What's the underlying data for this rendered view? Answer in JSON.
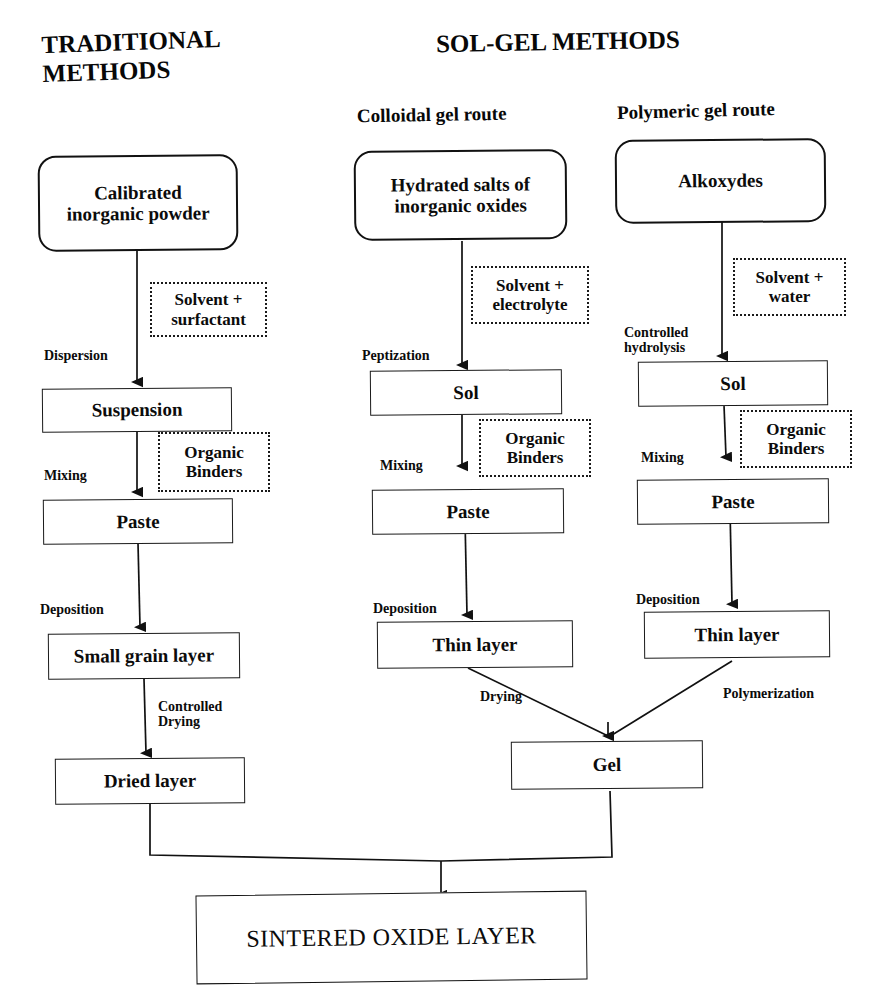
{
  "diagram": {
    "title_left": "TRADITIONAL\nMETHODS",
    "title_right": "SOL-GEL METHODS",
    "subtitle_colloidal": "Colloidal gel route",
    "subtitle_polymeric": "Polymeric gel route",
    "colors": {
      "ink": "#111111",
      "paper": "#ffffff"
    }
  },
  "traditional": {
    "start": "Calibrated\ninorganic powder",
    "reagent_1": "Solvent +\nsurfactant",
    "step_1": "Dispersion",
    "node_1": "Suspension",
    "reagent_2": "Organic\nBinders",
    "step_2": "Mixing",
    "node_2": "Paste",
    "step_3": "Deposition",
    "node_3": "Small grain layer",
    "step_4": "Controlled\nDrying",
    "node_4": "Dried layer"
  },
  "colloidal": {
    "start": "Hydrated salts of\ninorganic oxides",
    "reagent_1": "Solvent +\nelectrolyte",
    "step_1": "Peptization",
    "node_1": "Sol",
    "reagent_2": "Organic\nBinders",
    "step_2": "Mixing",
    "node_2": "Paste",
    "step_3": "Deposition",
    "node_3": "Thin layer",
    "step_4": "Drying"
  },
  "polymeric": {
    "start": "Alkoxydes",
    "reagent_1": "Solvent +\nwater",
    "step_1": "Controlled\nhydrolysis",
    "node_1": "Sol",
    "reagent_2": "Organic\nBinders",
    "step_2": "Mixing",
    "node_2": "Paste",
    "step_3": "Deposition",
    "node_3": "Thin layer",
    "step_4": "Polymerization"
  },
  "shared": {
    "gel": "Gel",
    "final": "SINTERED OXIDE LAYER"
  }
}
